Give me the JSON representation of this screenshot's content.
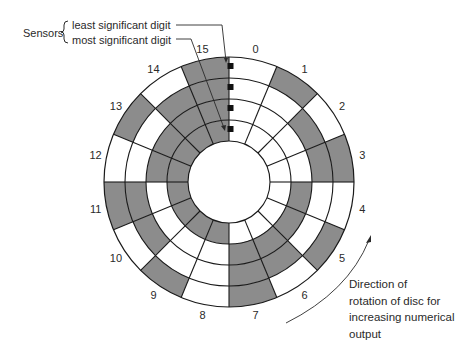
{
  "title_labels": {
    "sensors": "Sensors",
    "lsd": "least significant digit",
    "msd": "most significant digit"
  },
  "direction_note": {
    "lines": [
      "Direction of",
      "rotation of disc for",
      "increasing numerical",
      "output"
    ]
  },
  "disc": {
    "center": [
      229,
      182
    ],
    "ring_radii": [
      41,
      62,
      83,
      104,
      125
    ],
    "sector_count": 16,
    "label_radius": 136,
    "fill_color": "#8c8c8c",
    "line_color": "#1a1a1a",
    "sector_labels": [
      "0",
      "1",
      "2",
      "3",
      "4",
      "5",
      "6",
      "7",
      "8",
      "9",
      "10",
      "11",
      "12",
      "13",
      "14",
      "15"
    ],
    "ring_order_note": "outer ring = least significant digit, inner ring = most significant digit"
  },
  "sensors": {
    "color": "#111111",
    "positions_y": [
      66,
      87,
      108,
      129
    ],
    "x": 230
  }
}
